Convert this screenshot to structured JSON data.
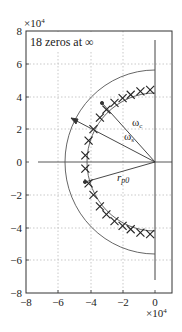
{
  "chart_data": {
    "type": "scatter",
    "title": "",
    "xlabel": "",
    "ylabel": "",
    "x_exponent_label": "×10^4",
    "y_exponent_label": "×10^4",
    "xlim": [
      -8,
      1
    ],
    "ylim": [
      -8,
      8
    ],
    "xticks": [
      -8,
      -6,
      -4,
      -2,
      0
    ],
    "yticks": [
      -8,
      -6,
      -4,
      -2,
      0,
      2,
      4,
      6,
      8
    ],
    "grid": true,
    "annotation_box": "18 zeros at ∞",
    "labels": {
      "omega_c": "ωc",
      "omega_s": "ωs",
      "r_p0": "rp0"
    },
    "outer_arc_radius": 5.6,
    "inner_arc_radius": 4.2,
    "poles_radius": 4.4,
    "pole_count": 18,
    "series": [
      {
        "name": "poles",
        "marker": "x",
        "points": [
          [
            -0.3,
            4.4
          ],
          [
            -0.9,
            4.3
          ],
          [
            -1.5,
            4.1
          ],
          [
            -2.0,
            3.9
          ],
          [
            -2.5,
            3.6
          ],
          [
            -3.0,
            3.2
          ],
          [
            -3.4,
            2.7
          ],
          [
            -3.8,
            2.0
          ],
          [
            -4.1,
            1.3
          ],
          [
            -4.3,
            0.4
          ],
          [
            -4.3,
            -0.4
          ],
          [
            -4.1,
            -1.3
          ],
          [
            -3.8,
            -2.0
          ],
          [
            -3.4,
            -2.7
          ],
          [
            -3.0,
            -3.2
          ],
          [
            -2.5,
            -3.6
          ],
          [
            -2.0,
            -3.9
          ],
          [
            -1.5,
            -4.1
          ],
          [
            -0.9,
            -4.3
          ],
          [
            -0.3,
            -4.4
          ]
        ]
      }
    ]
  },
  "text": {
    "annotation": "18 zeros at ∞",
    "x_exp": "×10",
    "y_exp": "×10",
    "exp_power": "4",
    "omega": "ω",
    "sub_c": "c",
    "sub_s": "s",
    "r": "r",
    "sub_p0": "p0",
    "xt": [
      "−8",
      "−6",
      "−4",
      "−2",
      "0"
    ],
    "yt": [
      "8",
      "6",
      "4",
      "2",
      "0",
      "−2",
      "−4",
      "−6",
      "−8"
    ]
  }
}
